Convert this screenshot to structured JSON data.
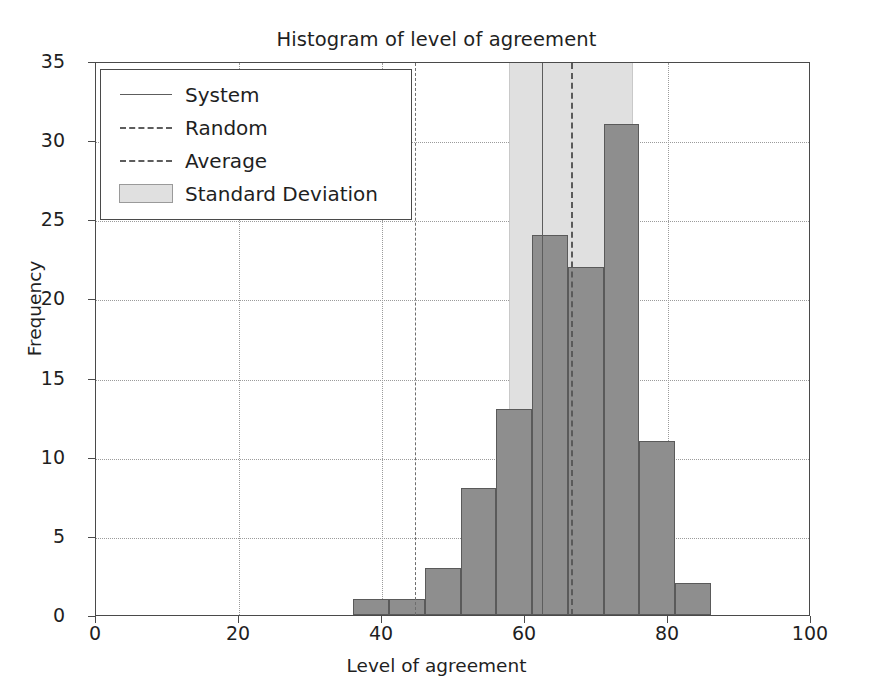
{
  "chart_data": {
    "type": "bar",
    "title": "Histogram of level of agreement",
    "xlabel": "Level of agreement",
    "ylabel": "Frequency",
    "xlim": [
      0,
      100
    ],
    "ylim": [
      0,
      35
    ],
    "grid": true,
    "bin_width": 5,
    "bin_starts": [
      36,
      41,
      46,
      51,
      56,
      61,
      66,
      71,
      76,
      81
    ],
    "bin_ranges": [
      "36-41",
      "41-46",
      "46-51",
      "51-56",
      "56-61",
      "61-66",
      "66-71",
      "71-76",
      "76-81",
      "81-86"
    ],
    "values": [
      1,
      1,
      3,
      8,
      13,
      24,
      22,
      31,
      11,
      2
    ],
    "xticks": [
      0,
      20,
      40,
      60,
      80,
      100
    ],
    "xtick_labels": [
      "0",
      "20",
      "40",
      "60",
      "80",
      "100"
    ],
    "yticks": [
      0,
      5,
      10,
      15,
      20,
      25,
      30,
      35
    ],
    "ytick_labels": [
      "0",
      "5",
      "10",
      "15",
      "20",
      "25",
      "30",
      "35"
    ],
    "annotations": {
      "system": {
        "label": "System",
        "x": 62.4,
        "style": "solid"
      },
      "random": {
        "label": "Random",
        "x": 44.6,
        "style": "dashdot"
      },
      "average": {
        "label": "Average",
        "x": 66.4,
        "style": "dashed"
      },
      "standard_deviation": {
        "label": "Standard Deviation",
        "x_start": 57.8,
        "x_end": 75.1,
        "style": "band"
      }
    },
    "legend_position": "upper left",
    "legend_entries": [
      {
        "label": "System",
        "key": "solid-line"
      },
      {
        "label": "Random",
        "key": "dashdot-line"
      },
      {
        "label": "Average",
        "key": "dashed-line"
      },
      {
        "label": "Standard Deviation",
        "key": "filled-patch"
      }
    ],
    "colors": {
      "bar_fill": "#8e8e8e",
      "bar_edge": "#5a5a5a",
      "sd_band": "#e0e0e0",
      "grid": "#9b9b9b",
      "axis": "#4a4a4a",
      "text": "#1f1f1f"
    }
  }
}
